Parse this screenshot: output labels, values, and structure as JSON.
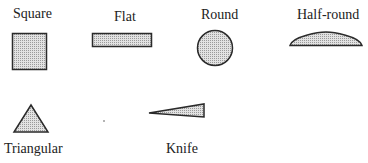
{
  "shapes": [
    {
      "id": "square",
      "label": "Square"
    },
    {
      "id": "flat",
      "label": "Flat"
    },
    {
      "id": "round",
      "label": "Round"
    },
    {
      "id": "half-round",
      "label": "Half-round"
    },
    {
      "id": "triangular",
      "label": "Triangular"
    },
    {
      "id": "knife",
      "label": "Knife"
    }
  ],
  "colors": {
    "fill": "#cfcfcf",
    "stroke": "#2a2a2a"
  }
}
